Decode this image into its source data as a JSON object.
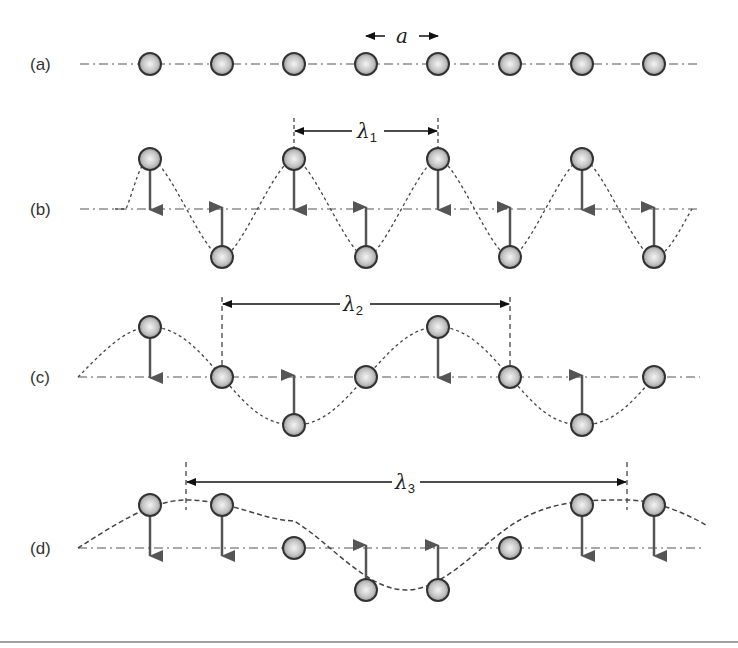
{
  "figure": {
    "colors": {
      "atom_fill_center": "#f2f2f2",
      "atom_fill_edge": "#8c8c8c",
      "atom_stroke": "#333333",
      "arrow": "#555555",
      "line": "#555555",
      "bottom_rule": "#a0a0a0"
    },
    "atom_x": [
      150,
      222,
      294,
      366,
      438,
      510,
      582,
      654
    ],
    "lattice_spacing_label": "a",
    "rows": [
      {
        "label": "(a)",
        "baseline_y": 64,
        "description": "Equilibrium chain, spacing a",
        "displacements": [
          0,
          0,
          0,
          0,
          0,
          0,
          0,
          0
        ],
        "arrows": []
      },
      {
        "label": "(b)",
        "baseline_y": 209,
        "wavelength_label": "λ",
        "wavelength_sub": "1",
        "wavelength_span_x": [
          294,
          438
        ],
        "wavelength_y": 131,
        "displacements": [
          -50,
          48,
          -50,
          48,
          -50,
          48,
          -50,
          48
        ],
        "arrows": [
          "down",
          "up",
          "down",
          "up",
          "down",
          "up",
          "down",
          "up"
        ]
      },
      {
        "label": "(c)",
        "baseline_y": 377,
        "wavelength_label": "λ",
        "wavelength_sub": "2",
        "wavelength_span_x": [
          222,
          510
        ],
        "wavelength_y": 304,
        "displacements": [
          -50,
          0,
          48,
          0,
          -50,
          0,
          48,
          0
        ],
        "arrows": [
          "down",
          "none",
          "up",
          "none",
          "down",
          "none",
          "up",
          "none"
        ]
      },
      {
        "label": "(d)",
        "baseline_y": 548,
        "wavelength_label": "λ",
        "wavelength_sub": "3",
        "wavelength_span_x": [
          186,
          627
        ],
        "wavelength_y": 482,
        "displacements": [
          -43,
          -43,
          0,
          42,
          42,
          0,
          -43,
          -43
        ],
        "arrows": [
          "down",
          "down",
          "none",
          "up",
          "up",
          "none",
          "down",
          "down"
        ]
      }
    ]
  }
}
